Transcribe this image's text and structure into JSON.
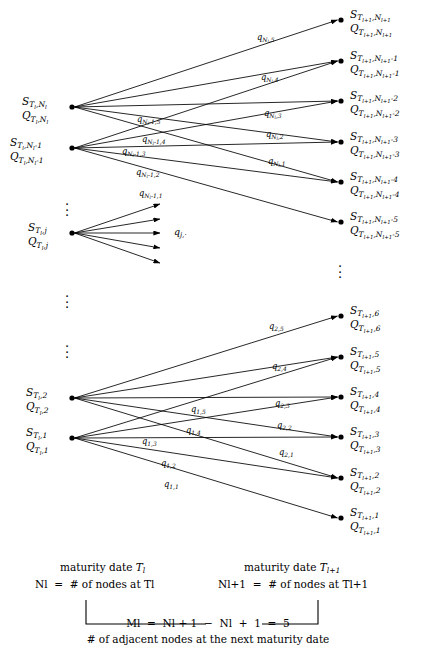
{
  "figure": {
    "type": "lattice-transition-diagram",
    "left_column_title_line1": "maturity date T_l",
    "left_column_title_line2": "N_l = # of nodes at T_l",
    "right_column_title_line1": "maturity date T_{l+1}",
    "right_column_title_line2": "N_{l+1} = # of nodes at T_{l+1}",
    "bracket_formula": "M_l = N_{l+1} - N_l + 1 = 5",
    "bracket_note": "# of adjacent nodes at the next maturity date",
    "branching_factor": 5,
    "ink_color": "#000000",
    "background_color": "#ffffff"
  },
  "left_nodes": [
    {
      "id": "L-top",
      "s": "S",
      "q": "Q",
      "sub_time": "T_l",
      "sub_index": "N_l",
      "x": 72,
      "y": 107
    },
    {
      "id": "L-top2",
      "s": "S",
      "q": "Q",
      "sub_time": "T_l",
      "sub_index": "N_l-1",
      "x": 72,
      "y": 148
    },
    {
      "id": "L-mid",
      "s": "S",
      "q": "Q",
      "sub_time": "T_l",
      "sub_index": "j",
      "x": 72,
      "y": 233
    },
    {
      "id": "L-bot2",
      "s": "S",
      "q": "Q",
      "sub_time": "T_l",
      "sub_index": "2",
      "x": 72,
      "y": 398
    },
    {
      "id": "L-bot",
      "s": "S",
      "q": "Q",
      "sub_time": "T_l",
      "sub_index": "1",
      "x": 72,
      "y": 438
    }
  ],
  "right_nodes": [
    {
      "id": "R1",
      "s": "S",
      "q": "Q",
      "sub_time": "T_{l+1}",
      "sub_index": "N_{l+1}",
      "x": 341,
      "y": 20
    },
    {
      "id": "R2",
      "s": "S",
      "q": "Q",
      "sub_time": "T_{l+1}",
      "sub_index": "N_{l+1}-1",
      "x": 341,
      "y": 61
    },
    {
      "id": "R3",
      "s": "S",
      "q": "Q",
      "sub_time": "T_{l+1}",
      "sub_index": "N_{l+1}-2",
      "x": 341,
      "y": 101
    },
    {
      "id": "R4",
      "s": "S",
      "q": "Q",
      "sub_time": "T_{l+1}",
      "sub_index": "N_{l+1}-3",
      "x": 341,
      "y": 142
    },
    {
      "id": "R5",
      "s": "S",
      "q": "Q",
      "sub_time": "T_{l+1}",
      "sub_index": "N_{l+1}-4",
      "x": 341,
      "y": 182
    },
    {
      "id": "R6",
      "s": "S",
      "q": "Q",
      "sub_time": "T_{l+1}",
      "sub_index": "N_{l+1}-5",
      "x": 341,
      "y": 222
    },
    {
      "id": "R7",
      "s": "S",
      "q": "Q",
      "sub_time": "T_{l+1}",
      "sub_index": "6",
      "x": 341,
      "y": 316
    },
    {
      "id": "R8",
      "s": "S",
      "q": "Q",
      "sub_time": "T_{l+1}",
      "sub_index": "5",
      "x": 341,
      "y": 357
    },
    {
      "id": "R9",
      "s": "S",
      "q": "Q",
      "sub_time": "T_{l+1}",
      "sub_index": "4",
      "x": 341,
      "y": 397
    },
    {
      "id": "R10",
      "s": "S",
      "q": "Q",
      "sub_time": "T_{l+1}",
      "sub_index": "3",
      "x": 341,
      "y": 437
    },
    {
      "id": "R11",
      "s": "S",
      "q": "Q",
      "sub_time": "T_{l+1}",
      "sub_index": "2",
      "x": 341,
      "y": 478
    },
    {
      "id": "R12",
      "s": "S",
      "q": "Q",
      "sub_time": "T_{l+1}",
      "sub_index": "1",
      "x": 341,
      "y": 518
    }
  ],
  "edges": [
    {
      "from": "L-top",
      "to": "R1",
      "label_base": "q",
      "label_sub": "N_l,5",
      "lx": 257,
      "ly": 33
    },
    {
      "from": "L-top",
      "to": "R2",
      "label_base": "q",
      "label_sub": "N_l,4",
      "lx": 261,
      "ly": 73
    },
    {
      "from": "L-top",
      "to": "R3",
      "label_base": "q",
      "label_sub": "N_l,3",
      "lx": 264,
      "ly": 109
    },
    {
      "from": "L-top",
      "to": "R4",
      "label_base": "q",
      "label_sub": "N_l,2",
      "lx": 266,
      "ly": 130
    },
    {
      "from": "L-top",
      "to": "R5",
      "label_base": "q",
      "label_sub": "N_l,1",
      "lx": 268,
      "ly": 157
    },
    {
      "from": "L-top2",
      "to": "R2",
      "label_base": "q",
      "label_sub": "N_l-1,5",
      "lx": 137,
      "ly": 115
    },
    {
      "from": "L-top2",
      "to": "R3",
      "label_base": "q",
      "label_sub": "N_l-1,4",
      "lx": 142,
      "ly": 135
    },
    {
      "from": "L-top2",
      "to": "R4",
      "label_base": "q",
      "label_sub": "N_l-1,3",
      "lx": 122,
      "ly": 147
    },
    {
      "from": "L-top2",
      "to": "R5",
      "label_base": "q",
      "label_sub": "N_l-1,2",
      "lx": 136,
      "ly": 168
    },
    {
      "from": "L-top2",
      "to": "R6",
      "label_base": "q",
      "label_sub": "N_l-1,1",
      "lx": 139,
      "ly": 189
    },
    {
      "from": "L-bot2",
      "to": "R7",
      "label_base": "q",
      "label_sub": "2,5",
      "lx": 269,
      "ly": 322
    },
    {
      "from": "L-bot2",
      "to": "R8",
      "label_base": "q",
      "label_sub": "2,4",
      "lx": 272,
      "ly": 362
    },
    {
      "from": "L-bot2",
      "to": "R9",
      "label_base": "q",
      "label_sub": "2,3",
      "lx": 275,
      "ly": 399
    },
    {
      "from": "L-bot2",
      "to": "R10",
      "label_base": "q",
      "label_sub": "2,2",
      "lx": 277,
      "ly": 421
    },
    {
      "from": "L-bot2",
      "to": "R11",
      "label_base": "q",
      "label_sub": "2,1",
      "lx": 279,
      "ly": 448
    },
    {
      "from": "L-bot",
      "to": "R8",
      "label_base": "q",
      "label_sub": "1,5",
      "lx": 191,
      "ly": 405
    },
    {
      "from": "L-bot",
      "to": "R9",
      "label_base": "q",
      "label_sub": "1,4",
      "lx": 186,
      "ly": 426
    },
    {
      "from": "L-bot",
      "to": "R10",
      "label_base": "q",
      "label_sub": "1,3",
      "lx": 142,
      "ly": 437
    },
    {
      "from": "L-bot",
      "to": "R11",
      "label_base": "q",
      "label_sub": "1,2",
      "lx": 161,
      "ly": 459
    },
    {
      "from": "L-bot",
      "to": "R12",
      "label_base": "q",
      "label_sub": "1,1",
      "lx": 164,
      "ly": 480
    }
  ],
  "middle_fan": {
    "origin_x": 72,
    "origin_y": 233,
    "tip_x": 160,
    "tips_y": [
      204,
      219,
      233,
      248,
      263
    ],
    "label_base": "q",
    "label_sub": "j,·",
    "label_x": 174,
    "label_y": 227
  },
  "ellipses": [
    {
      "name": "left-upper-ellipsis",
      "x": 68,
      "y": 198
    },
    {
      "name": "left-lower-ellipsis",
      "x": 68,
      "y": 290
    },
    {
      "name": "right-ellipsis",
      "x": 341,
      "y": 258
    },
    {
      "name": "left-bottom-ellipsis",
      "x": 68,
      "y": 340
    }
  ]
}
